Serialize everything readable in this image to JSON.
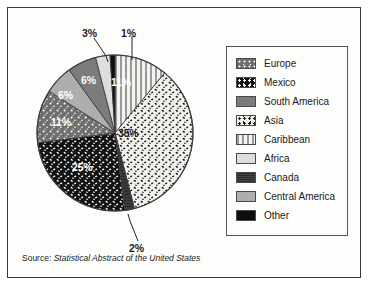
{
  "figure": {
    "source_prefix": "Source:",
    "source_title": "Statistical Abstract of the United States"
  },
  "legend": {
    "items": [
      {
        "label": "Europe",
        "pattern": "dark-gray-white-speckle",
        "color": "#6f6f6f"
      },
      {
        "label": "Mexico",
        "pattern": "black-white-speckle",
        "color": "#121212"
      },
      {
        "label": "South America",
        "pattern": "solid-medium-gray",
        "color": "#7c7c7c"
      },
      {
        "label": "Asia",
        "pattern": "white-black-speckle",
        "color": "#f2f1ee"
      },
      {
        "label": "Caribbean",
        "pattern": "vertical-stripes",
        "color": "#9a9a9a"
      },
      {
        "label": "Africa",
        "pattern": "solid-light-gray",
        "color": "#dedede"
      },
      {
        "label": "Canada",
        "pattern": "solid-very-dark-gray",
        "color": "#3b3b3b"
      },
      {
        "label": "Central America",
        "pattern": "solid-light-medium-gray",
        "color": "#aeaeae"
      },
      {
        "label": "Other",
        "pattern": "solid-black",
        "color": "#0d0d0d"
      }
    ]
  },
  "chart_data": {
    "type": "pie",
    "title": "",
    "legend_position": "right",
    "start_angle_deg": 0,
    "direction": "clockwise",
    "categories": [
      "Caribbean",
      "Asia",
      "Canada",
      "Mexico",
      "Europe",
      "Central America",
      "South America",
      "Africa",
      "Other"
    ],
    "values": [
      11,
      35,
      2,
      25,
      11,
      6,
      6,
      3,
      1
    ],
    "value_unit": "%",
    "labels": [
      "11%",
      "35%",
      "2%",
      "25%",
      "11%",
      "6%",
      "6%",
      "3%",
      "1%"
    ],
    "slices": [
      {
        "name": "Caribbean",
        "value": 11,
        "label": "11%",
        "label_placement": "inside",
        "color": "#9a9a9a"
      },
      {
        "name": "Asia",
        "value": 35,
        "label": "35%",
        "label_placement": "inside",
        "color": "#f2f1ee"
      },
      {
        "name": "Canada",
        "value": 2,
        "label": "2%",
        "label_placement": "outside",
        "color": "#3b3b3b"
      },
      {
        "name": "Mexico",
        "value": 25,
        "label": "25%",
        "label_placement": "inside",
        "color": "#121212"
      },
      {
        "name": "Europe",
        "value": 11,
        "label": "11%",
        "label_placement": "inside",
        "color": "#6f6f6f"
      },
      {
        "name": "Central America",
        "value": 6,
        "label": "6%",
        "label_placement": "inside",
        "color": "#aeaeae"
      },
      {
        "name": "South America",
        "value": 6,
        "label": "6%",
        "label_placement": "inside",
        "color": "#7c7c7c"
      },
      {
        "name": "Africa",
        "value": 3,
        "label": "3%",
        "label_placement": "outside",
        "color": "#dedede"
      },
      {
        "name": "Other",
        "value": 1,
        "label": "1%",
        "label_placement": "outside",
        "color": "#0d0d0d"
      }
    ]
  },
  "pie_labels": {
    "caribbean": "11%",
    "asia": "35%",
    "canada": "2%",
    "mexico": "25%",
    "europe": "11%",
    "central_america": "6%",
    "south_america": "6%",
    "africa": "3%",
    "other": "1%"
  }
}
